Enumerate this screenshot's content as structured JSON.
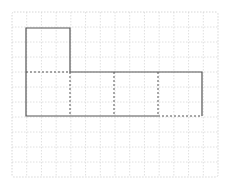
{
  "diagram": {
    "type": "net-of-cube",
    "grid": {
      "x": 12,
      "y": 12,
      "width": 206,
      "height": 165,
      "cols": 14,
      "rows": 11,
      "line_color": "#e0e0e0",
      "border_color": "#d6d6d6"
    },
    "shape": {
      "square_size": 44,
      "origin_x": 26,
      "origin_y": 28,
      "solid_color": "#555555",
      "dashed_color": "#555555",
      "squares": [
        {
          "col": 0,
          "row": 0
        },
        {
          "col": 0,
          "row": 1
        },
        {
          "col": 1,
          "row": 1
        },
        {
          "col": 2,
          "row": 1
        },
        {
          "col": 3,
          "row": 1
        }
      ],
      "fold_lines": [
        {
          "from": [
            0,
            1
          ],
          "to": [
            1,
            1
          ]
        },
        {
          "from": [
            1,
            1
          ],
          "to": [
            1,
            2
          ]
        },
        {
          "from": [
            2,
            1
          ],
          "to": [
            2,
            2
          ]
        },
        {
          "from": [
            3,
            1
          ],
          "to": [
            3,
            2
          ]
        },
        {
          "from": [
            3,
            2
          ],
          "to": [
            4,
            2
          ]
        }
      ]
    }
  }
}
